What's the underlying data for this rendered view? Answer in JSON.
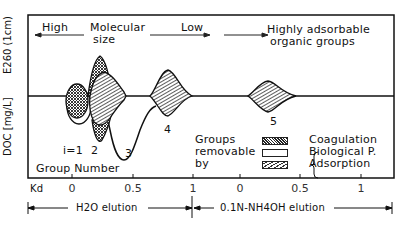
{
  "diagram": {
    "y_axis": {
      "upper_label": "E260 (1cm)",
      "lower_label": "DOC [mg/L]"
    },
    "header": {
      "left_high": "High",
      "molecular_line1": "Molecular",
      "molecular_line2": "size",
      "low": "Low",
      "adsorbable_line1": "Highly adsorbable",
      "adsorbable_line2": "organic groups"
    },
    "group_label": "Group Number",
    "peaks": [
      {
        "label": "i=1"
      },
      {
        "label": "2"
      },
      {
        "label": "3"
      },
      {
        "label": "4"
      },
      {
        "label": "5"
      }
    ],
    "legend": {
      "title_line1": "Groups",
      "title_line2": "removable",
      "title_line3": "by",
      "items": [
        {
          "label": "Coagulation",
          "pattern": "crosshatch"
        },
        {
          "label": "Biological P.",
          "pattern": "blank"
        },
        {
          "label": "Adsorption",
          "pattern": "diagonal"
        }
      ]
    },
    "x_axis": {
      "kd_label": "Kd",
      "ticks_h2o": [
        "0",
        "0.5",
        "1"
      ],
      "ticks_nh4oh": [
        "0",
        "0.5",
        "1"
      ],
      "elution_h2o": "H2O elution",
      "elution_nh4oh": "0.1N-NH4OH elution"
    }
  }
}
